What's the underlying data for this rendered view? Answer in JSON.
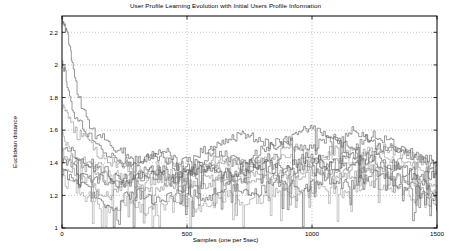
{
  "chart_data": {
    "type": "line",
    "title": "User Profile Learning Evolution with Initial Users Profile Information",
    "xlabel": "Samples (one per 5sec)",
    "ylabel": "Euclidean distance",
    "xlim": [
      0,
      1500
    ],
    "ylim": [
      1,
      2.3
    ],
    "xticks": [
      0,
      500,
      1000,
      1500
    ],
    "xtick_labels": [
      "0",
      "500",
      "1000",
      "1500"
    ],
    "yticks": [
      1,
      1.2,
      1.4,
      1.6,
      1.8,
      2,
      2.2
    ],
    "ytick_labels": [
      "1",
      "1.2",
      "1.4",
      "1.6",
      "1.8",
      "2",
      "2.2"
    ],
    "grid": true,
    "grid_style": "dotted",
    "legend": "none",
    "line_color": "#5a5a5a",
    "background": "#ffffff",
    "axis_color": "#000000",
    "series_count": 10,
    "series": [
      {
        "name": "user-1",
        "x": [
          0,
          8,
          16,
          24,
          32,
          40,
          55,
          70,
          90,
          110,
          140,
          170,
          200,
          240,
          280,
          320,
          360,
          400,
          440,
          480,
          520,
          560,
          600,
          640,
          680,
          720,
          760,
          800,
          840,
          880,
          920,
          960,
          1000,
          1040,
          1080,
          1120,
          1160,
          1200,
          1240,
          1280,
          1320,
          1360,
          1400,
          1440,
          1480,
          1500
        ],
        "y": [
          2.28,
          2.24,
          2.22,
          2.18,
          2.1,
          2.0,
          1.88,
          1.78,
          1.7,
          1.62,
          1.58,
          1.55,
          1.5,
          1.47,
          1.44,
          1.42,
          1.45,
          1.48,
          1.44,
          1.4,
          1.43,
          1.47,
          1.5,
          1.52,
          1.55,
          1.58,
          1.56,
          1.53,
          1.5,
          1.52,
          1.56,
          1.6,
          1.62,
          1.58,
          1.55,
          1.57,
          1.6,
          1.56,
          1.52,
          1.48,
          1.5,
          1.47,
          1.44,
          1.42,
          1.4,
          1.4
        ]
      },
      {
        "name": "user-2",
        "x": [
          0,
          10,
          20,
          35,
          50,
          70,
          95,
          120,
          150,
          185,
          220,
          260,
          300,
          345,
          390,
          435,
          480,
          525,
          570,
          615,
          660,
          705,
          750,
          795,
          840,
          885,
          930,
          975,
          1020,
          1065,
          1110,
          1155,
          1200,
          1245,
          1290,
          1335,
          1380,
          1425,
          1470,
          1500
        ],
        "y": [
          2.02,
          1.96,
          1.88,
          1.78,
          1.7,
          1.64,
          1.58,
          1.54,
          1.5,
          1.46,
          1.42,
          1.4,
          1.38,
          1.42,
          1.45,
          1.4,
          1.36,
          1.38,
          1.42,
          1.46,
          1.44,
          1.4,
          1.43,
          1.47,
          1.5,
          1.54,
          1.52,
          1.48,
          1.51,
          1.55,
          1.53,
          1.5,
          1.54,
          1.58,
          1.55,
          1.5,
          1.46,
          1.44,
          1.42,
          1.41
        ]
      },
      {
        "name": "user-3",
        "x": [
          0,
          12,
          25,
          40,
          60,
          85,
          110,
          140,
          175,
          210,
          250,
          290,
          335,
          380,
          425,
          470,
          515,
          560,
          605,
          650,
          695,
          740,
          785,
          830,
          875,
          920,
          965,
          1010,
          1055,
          1100,
          1145,
          1190,
          1235,
          1280,
          1325,
          1370,
          1415,
          1460,
          1500
        ],
        "y": [
          1.74,
          1.7,
          1.66,
          1.62,
          1.58,
          1.54,
          1.5,
          1.46,
          1.42,
          1.4,
          1.38,
          1.36,
          1.34,
          1.37,
          1.4,
          1.38,
          1.35,
          1.37,
          1.4,
          1.43,
          1.41,
          1.38,
          1.4,
          1.43,
          1.46,
          1.48,
          1.46,
          1.43,
          1.45,
          1.48,
          1.46,
          1.44,
          1.47,
          1.5,
          1.47,
          1.44,
          1.42,
          1.4,
          1.39
        ]
      },
      {
        "name": "user-4",
        "x": [
          0,
          15,
          30,
          50,
          75,
          100,
          130,
          165,
          200,
          240,
          285,
          330,
          375,
          420,
          465,
          510,
          555,
          600,
          645,
          690,
          735,
          780,
          825,
          870,
          915,
          960,
          1005,
          1050,
          1095,
          1140,
          1185,
          1230,
          1275,
          1320,
          1365,
          1410,
          1455,
          1500
        ],
        "y": [
          1.56,
          1.52,
          1.48,
          1.44,
          1.42,
          1.4,
          1.38,
          1.36,
          1.34,
          1.32,
          1.3,
          1.33,
          1.36,
          1.34,
          1.31,
          1.33,
          1.36,
          1.39,
          1.42,
          1.4,
          1.37,
          1.39,
          1.42,
          1.45,
          1.43,
          1.4,
          1.42,
          1.45,
          1.43,
          1.41,
          1.44,
          1.47,
          1.45,
          1.42,
          1.4,
          1.38,
          1.37,
          1.36
        ]
      },
      {
        "name": "user-5",
        "x": [
          0,
          18,
          36,
          58,
          82,
          110,
          142,
          178,
          215,
          255,
          300,
          345,
          392,
          440,
          488,
          535,
          582,
          630,
          678,
          725,
          772,
          820,
          868,
          915,
          962,
          1010,
          1058,
          1105,
          1152,
          1200,
          1248,
          1295,
          1342,
          1390,
          1438,
          1485,
          1500
        ],
        "y": [
          1.42,
          1.4,
          1.38,
          1.36,
          1.34,
          1.32,
          1.3,
          1.28,
          1.26,
          1.28,
          1.31,
          1.34,
          1.32,
          1.29,
          1.31,
          1.34,
          1.37,
          1.35,
          1.32,
          1.34,
          1.37,
          1.4,
          1.38,
          1.36,
          1.38,
          1.41,
          1.39,
          1.37,
          1.4,
          1.43,
          1.41,
          1.38,
          1.36,
          1.34,
          1.33,
          1.32,
          1.32
        ]
      },
      {
        "name": "user-6",
        "x": [
          0,
          20,
          42,
          65,
          92,
          122,
          155,
          192,
          232,
          275,
          320,
          368,
          415,
          465,
          512,
          560,
          608,
          655,
          702,
          750,
          798,
          845,
          892,
          940,
          988,
          1035,
          1082,
          1130,
          1178,
          1225,
          1272,
          1320,
          1368,
          1415,
          1462,
          1500
        ],
        "y": [
          1.38,
          1.36,
          1.34,
          1.32,
          1.3,
          1.26,
          1.22,
          1.2,
          1.24,
          1.28,
          1.25,
          1.22,
          1.26,
          1.3,
          1.28,
          1.25,
          1.28,
          1.32,
          1.3,
          1.27,
          1.3,
          1.34,
          1.32,
          1.3,
          1.33,
          1.36,
          1.34,
          1.31,
          1.34,
          1.37,
          1.35,
          1.32,
          1.3,
          1.28,
          1.27,
          1.26
        ]
      },
      {
        "name": "user-7",
        "x": [
          0,
          22,
          45,
          70,
          98,
          130,
          165,
          205,
          248,
          292,
          338,
          385,
          432,
          480,
          528,
          575,
          622,
          670,
          718,
          765,
          812,
          860,
          908,
          955,
          1002,
          1050,
          1098,
          1145,
          1192,
          1240,
          1288,
          1335,
          1382,
          1430,
          1478,
          1500
        ],
        "y": [
          1.34,
          1.32,
          1.3,
          1.27,
          1.24,
          1.2,
          1.16,
          1.14,
          1.18,
          1.22,
          1.19,
          1.16,
          1.2,
          1.24,
          1.21,
          1.18,
          1.22,
          1.26,
          1.24,
          1.21,
          1.25,
          1.29,
          1.27,
          1.24,
          1.27,
          1.31,
          1.29,
          1.26,
          1.29,
          1.33,
          1.31,
          1.28,
          1.25,
          1.22,
          1.2,
          1.19
        ]
      },
      {
        "name": "user-8",
        "x": [
          0,
          25,
          50,
          78,
          108,
          142,
          180,
          222,
          266,
          312,
          360,
          408,
          456,
          505,
          552,
          600,
          648,
          696,
          744,
          792,
          840,
          888,
          936,
          984,
          1032,
          1080,
          1128,
          1176,
          1224,
          1272,
          1320,
          1368,
          1416,
          1464,
          1500
        ],
        "y": [
          1.3,
          1.28,
          1.25,
          1.22,
          1.18,
          1.14,
          1.1,
          1.12,
          1.16,
          1.13,
          1.1,
          1.14,
          1.18,
          1.15,
          1.12,
          1.16,
          1.2,
          1.18,
          1.15,
          1.19,
          1.23,
          1.21,
          1.18,
          1.22,
          1.26,
          1.24,
          1.21,
          1.25,
          1.29,
          1.27,
          1.24,
          1.21,
          1.18,
          1.16,
          1.15
        ]
      },
      {
        "name": "user-9",
        "x": [
          0,
          28,
          56,
          86,
          118,
          154,
          194,
          238,
          284,
          332,
          382,
          432,
          482,
          532,
          582,
          632,
          682,
          732,
          782,
          832,
          882,
          932,
          982,
          1032,
          1082,
          1132,
          1182,
          1232,
          1282,
          1332,
          1382,
          1432,
          1482,
          1500
        ],
        "y": [
          1.46,
          1.44,
          1.41,
          1.38,
          1.35,
          1.32,
          1.29,
          1.26,
          1.24,
          1.27,
          1.3,
          1.28,
          1.25,
          1.28,
          1.32,
          1.3,
          1.27,
          1.3,
          1.34,
          1.32,
          1.29,
          1.33,
          1.37,
          1.35,
          1.32,
          1.35,
          1.39,
          1.37,
          1.34,
          1.31,
          1.28,
          1.25,
          1.22,
          1.2
        ]
      },
      {
        "name": "user-10",
        "x": [
          0,
          30,
          60,
          92,
          126,
          164,
          206,
          252,
          300,
          350,
          402,
          454,
          506,
          558,
          610,
          662,
          714,
          766,
          818,
          870,
          922,
          974,
          1026,
          1078,
          1130,
          1182,
          1234,
          1286,
          1338,
          1390,
          1442,
          1494,
          1500
        ],
        "y": [
          1.5,
          1.47,
          1.44,
          1.41,
          1.38,
          1.35,
          1.32,
          1.3,
          1.33,
          1.36,
          1.34,
          1.31,
          1.34,
          1.38,
          1.36,
          1.33,
          1.36,
          1.4,
          1.38,
          1.35,
          1.39,
          1.43,
          1.41,
          1.38,
          1.42,
          1.46,
          1.44,
          1.41,
          1.38,
          1.34,
          1.28,
          1.16,
          1.12
        ]
      }
    ]
  }
}
